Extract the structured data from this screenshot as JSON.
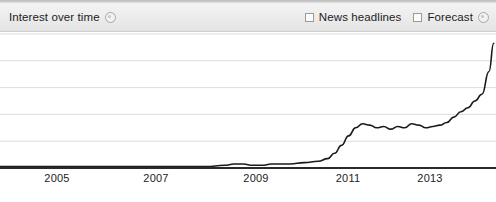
{
  "panel": {
    "title": "Interest over time",
    "title_help_icon": "help-circle-icon"
  },
  "controls": [
    {
      "label": "News headlines",
      "checked": false,
      "icon": "checkbox-unchecked-icon"
    },
    {
      "label": "Forecast",
      "checked": false,
      "icon": "checkbox-unchecked-icon",
      "help_icon": "help-circle-icon"
    }
  ],
  "colors": {
    "line": "#1a1a1a",
    "gridline": "#dddddd",
    "axis": "#2b2b2b",
    "header_top": "#f4f4f4",
    "header_bottom": "#e3e3e3",
    "background": "#ffffff",
    "text": "#1d1d1d"
  },
  "chart_data": {
    "type": "line",
    "title": "Interest over time",
    "xlabel": "",
    "ylabel": "",
    "grid": true,
    "legend": "none",
    "xlim": [
      2004.0,
      2014.6
    ],
    "ylim": [
      0,
      100
    ],
    "gridline_values": [
      100,
      80,
      60,
      40,
      20
    ],
    "tick_labels": [
      "2005",
      "2007",
      "2009",
      "2011",
      "2013"
    ],
    "tick_values": [
      2005,
      2007,
      2009,
      2011,
      2013
    ],
    "series": [
      {
        "name": "Interest",
        "x": [
          2004.0,
          2004.4,
          2004.8,
          2005.2,
          2005.6,
          2006.0,
          2006.4,
          2006.8,
          2007.2,
          2007.6,
          2008.0,
          2008.4,
          2008.8,
          2009.0,
          2009.2,
          2009.4,
          2009.6,
          2009.8,
          2010.0,
          2010.2,
          2010.5,
          2010.8,
          2011.0,
          2011.15,
          2011.3,
          2011.45,
          2011.6,
          2011.75,
          2011.9,
          2012.05,
          2012.2,
          2012.35,
          2012.5,
          2012.65,
          2012.8,
          2012.95,
          2013.1,
          2013.25,
          2013.4,
          2013.55,
          2013.7,
          2013.85,
          2014.0,
          2014.15,
          2014.3,
          2014.45,
          2014.55
        ],
        "values": [
          1,
          1,
          1,
          1,
          1,
          1,
          1,
          1,
          1,
          1,
          1,
          1,
          2,
          3,
          3,
          2,
          2,
          3,
          3,
          3,
          4,
          5,
          7,
          11,
          17,
          24,
          30,
          33,
          32,
          30,
          31,
          29,
          31,
          30,
          33,
          32,
          30,
          31,
          32,
          34,
          38,
          42,
          45,
          50,
          55,
          72,
          93
        ]
      }
    ]
  },
  "axis": {
    "tick_positions_px": [
      57,
      156,
      256,
      348,
      430
    ]
  }
}
